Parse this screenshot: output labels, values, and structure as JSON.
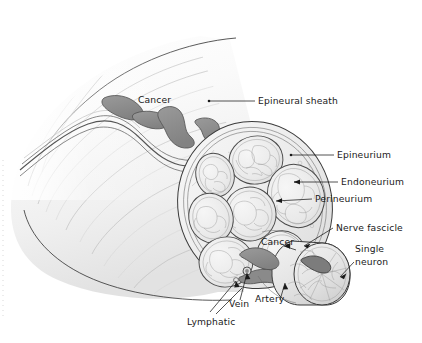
{
  "figure": {
    "type": "anatomical-illustration",
    "background_color": "#ffffff",
    "width": 422,
    "height": 343
  },
  "palette": {
    "background": "#ffffff",
    "outline": "#3a3a3a",
    "tumor_fill": "#8e8e8e",
    "tumor_outline": "#4a4a4a",
    "tissue_light": "#f4f4f4",
    "tissue_mid": "#e6e6e6",
    "tissue_shadow": "#d8d8d8",
    "fascicle_fill": "#efefef",
    "vessel_gray": "#8a8a8a",
    "label_color": "#1a1a1a",
    "leader_color": "#1a1a1a"
  },
  "labels": {
    "epineural_sheath": "Epineural sheath",
    "epineurium": "Epineurium",
    "endoneurium": "Endoneurium",
    "perineurium": "Perineurium",
    "nerve_fascicle": "Nerve fascicle",
    "single_neuron_line1": "Single",
    "single_neuron_line2": "neuron",
    "cancer_trunk": "Cancer",
    "cancer_inset": "Cancer",
    "vein": "Vein",
    "artery": "Artery",
    "lymphatic": "Lymphatic"
  },
  "structures": {
    "nerve_trunk": "longitudinal nerve trunk fading toward upper left",
    "cross_section": "oblique elliptical cut face showing seven fascicles",
    "fascicle_count": 7,
    "inset": "magnified single fascicle cylinder with cancer deposit",
    "tumor_deposits_trunk": 4,
    "vascular_bundle": "vein, artery and lymphatic at inferior margin"
  }
}
